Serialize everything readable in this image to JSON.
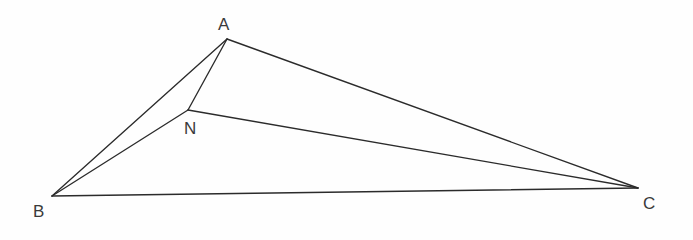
{
  "figure": {
    "background_color": "#fefefe",
    "line_color": "#2b2b2b",
    "label_color": "#3a3a3a",
    "width": 693,
    "height": 240
  },
  "points": {
    "A": {
      "label": "A",
      "x": 227,
      "y": 39,
      "label_x": 218,
      "label_y": 16
    },
    "B": {
      "label": "B",
      "x": 52,
      "y": 196,
      "label_x": 33,
      "label_y": 203
    },
    "C": {
      "label": "C",
      "x": 638,
      "y": 188,
      "label_x": 643,
      "label_y": 195
    },
    "N": {
      "label": "N",
      "x": 188,
      "y": 110,
      "label_x": 184,
      "label_y": 120
    }
  },
  "segments": [
    {
      "name": "AB",
      "from": "A",
      "to": "B"
    },
    {
      "name": "AN",
      "from": "A",
      "to": "N"
    },
    {
      "name": "AC",
      "from": "A",
      "to": "C"
    },
    {
      "name": "BN",
      "from": "B",
      "to": "N"
    },
    {
      "name": "NC",
      "from": "N",
      "to": "C"
    },
    {
      "name": "BC",
      "from": "B",
      "to": "C"
    }
  ],
  "chart_data": {
    "type": "scatter",
    "xlabel": "",
    "ylabel": "",
    "xlim": [
      0,
      693
    ],
    "ylim": [
      240,
      0
    ],
    "grid": false,
    "legend": "none",
    "categories": [
      "A",
      "B",
      "C",
      "N"
    ],
    "x": [
      227,
      52,
      638,
      188
    ],
    "y": [
      39,
      196,
      188,
      110
    ],
    "series": [
      {
        "name": "vertices",
        "values": [
          39,
          196,
          188,
          110
        ]
      }
    ],
    "annotations": [
      "A",
      "B",
      "C",
      "N"
    ],
    "edges": [
      "A-B",
      "A-N",
      "A-C",
      "B-N",
      "N-C",
      "B-C"
    ]
  }
}
